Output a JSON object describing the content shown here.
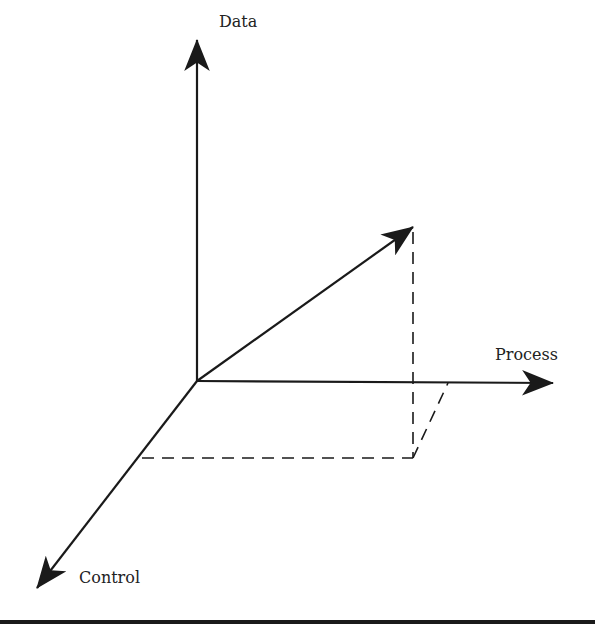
{
  "diagram": {
    "type": "3d-axes-vector",
    "axes": [
      {
        "name": "data",
        "label": "Data"
      },
      {
        "name": "process",
        "label": "Process"
      },
      {
        "name": "control",
        "label": "Control"
      }
    ],
    "vector": {
      "description": "resultant vector from origin into the Data-Process-Control space with dashed projection lines"
    },
    "colors": {
      "line": "#1a1a1a",
      "text": "#222222",
      "background": "#ffffff"
    }
  }
}
